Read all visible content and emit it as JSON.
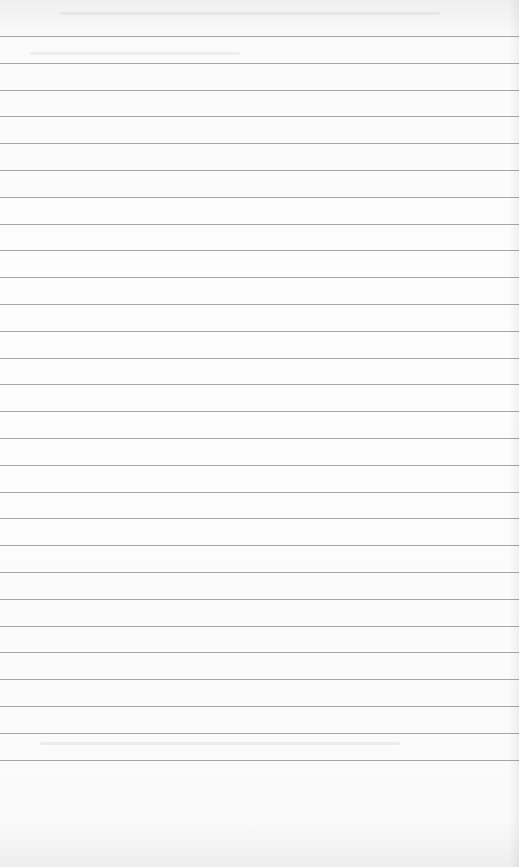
{
  "image": {
    "description": "Blank sheet of ruled notebook paper",
    "paper_color": "#fcfcfc",
    "rule_color": "#8a8a8a",
    "rule_count": 28,
    "first_rule_y": 36,
    "rule_spacing_px": 26.8,
    "visible_text": []
  }
}
